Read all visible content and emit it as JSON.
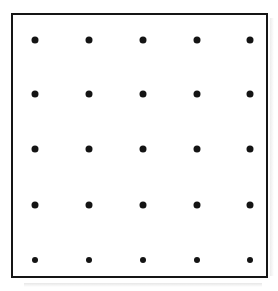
{
  "figure": {
    "kind": "dot-grid-diagram",
    "canvas": {
      "width": 278,
      "height": 291,
      "background": "#ffffff"
    },
    "frame": {
      "name": "square-border",
      "x": 11,
      "y": 13,
      "width": 257,
      "height": 265,
      "border_width": 2,
      "border_color": "#151515",
      "fill": "#ffffff"
    },
    "lattice": {
      "rows": 5,
      "columns": 5,
      "dot_count": 25,
      "dot_color": "#141414",
      "column_centers_x": [
        22,
        76,
        130,
        184,
        237
      ],
      "row_centers_y": [
        25,
        79,
        134,
        190,
        245
      ],
      "column_spacing": 54,
      "row_spacing": 55,
      "dot_diameters": [
        7,
        7,
        7,
        7,
        6
      ],
      "dots": [
        {
          "row": 1,
          "col": 1,
          "cx": 22,
          "cy": 25,
          "d": 7
        },
        {
          "row": 1,
          "col": 2,
          "cx": 76,
          "cy": 25,
          "d": 7
        },
        {
          "row": 1,
          "col": 3,
          "cx": 130,
          "cy": 25,
          "d": 7
        },
        {
          "row": 1,
          "col": 4,
          "cx": 184,
          "cy": 25,
          "d": 7
        },
        {
          "row": 1,
          "col": 5,
          "cx": 237,
          "cy": 25,
          "d": 7
        },
        {
          "row": 2,
          "col": 1,
          "cx": 22,
          "cy": 79,
          "d": 7
        },
        {
          "row": 2,
          "col": 2,
          "cx": 76,
          "cy": 79,
          "d": 7
        },
        {
          "row": 2,
          "col": 3,
          "cx": 130,
          "cy": 79,
          "d": 7
        },
        {
          "row": 2,
          "col": 4,
          "cx": 184,
          "cy": 79,
          "d": 7
        },
        {
          "row": 2,
          "col": 5,
          "cx": 237,
          "cy": 79,
          "d": 7
        },
        {
          "row": 3,
          "col": 1,
          "cx": 22,
          "cy": 134,
          "d": 7
        },
        {
          "row": 3,
          "col": 2,
          "cx": 76,
          "cy": 134,
          "d": 7
        },
        {
          "row": 3,
          "col": 3,
          "cx": 130,
          "cy": 134,
          "d": 7
        },
        {
          "row": 3,
          "col": 4,
          "cx": 184,
          "cy": 134,
          "d": 7
        },
        {
          "row": 3,
          "col": 5,
          "cx": 237,
          "cy": 134,
          "d": 7
        },
        {
          "row": 4,
          "col": 1,
          "cx": 22,
          "cy": 190,
          "d": 7
        },
        {
          "row": 4,
          "col": 2,
          "cx": 76,
          "cy": 190,
          "d": 7
        },
        {
          "row": 4,
          "col": 3,
          "cx": 130,
          "cy": 190,
          "d": 7
        },
        {
          "row": 4,
          "col": 4,
          "cx": 184,
          "cy": 190,
          "d": 7
        },
        {
          "row": 4,
          "col": 5,
          "cx": 237,
          "cy": 190,
          "d": 7
        },
        {
          "row": 5,
          "col": 1,
          "cx": 22,
          "cy": 245,
          "d": 6
        },
        {
          "row": 5,
          "col": 2,
          "cx": 76,
          "cy": 245,
          "d": 6
        },
        {
          "row": 5,
          "col": 3,
          "cx": 130,
          "cy": 245,
          "d": 6
        },
        {
          "row": 5,
          "col": 4,
          "cx": 184,
          "cy": 245,
          "d": 6
        },
        {
          "row": 5,
          "col": 5,
          "cx": 237,
          "cy": 245,
          "d": 6
        }
      ]
    },
    "artifacts": {
      "bottom_shadow": true,
      "right_shadow": true
    },
    "labels": {
      "text_items": []
    }
  }
}
